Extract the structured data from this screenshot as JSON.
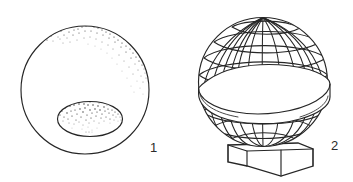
{
  "figure": {
    "name": "two-panel-line-illustration",
    "background_color": "#ffffff",
    "ink_color": "#262626",
    "width": 353,
    "height": 182,
    "panels": [
      {
        "id": "panel-1",
        "caption": "1",
        "caption_position": {
          "x": 150,
          "y": 152
        },
        "subject": "stippled-sphere-with-oval-depression",
        "outer_circle": {
          "cx": 85,
          "cy": 90,
          "r": 64
        },
        "inner_ellipse": {
          "cx": 90,
          "cy": 119,
          "rx": 33,
          "ry": 18
        },
        "stipple_regions": [
          "upper-rim-arc",
          "inner-ellipse-upper"
        ]
      },
      {
        "id": "panel-2",
        "caption": "2",
        "caption_position": {
          "x": 331,
          "y": 150
        },
        "subject": "latticed-globe-with-equatorial-ring-on-pedestal",
        "sphere": {
          "cx": 263,
          "cy": 82,
          "r": 65
        },
        "equatorial_ring": {
          "cy": 95,
          "thickness": 13
        },
        "meridian_count": 11,
        "parallel_count": 9,
        "base": {
          "type": "hexagonal-pedestal",
          "top_y": 143,
          "bottom_y": 176
        }
      }
    ]
  },
  "captions": {
    "one": "1",
    "two": "2"
  }
}
